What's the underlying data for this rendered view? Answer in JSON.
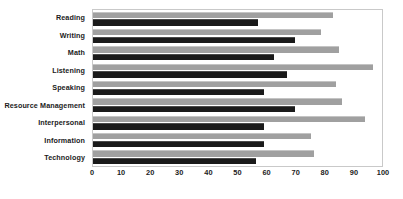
{
  "chart_data": {
    "type": "bar",
    "orientation": "horizontal",
    "title": "",
    "subtitle": "",
    "xlabel": "",
    "ylabel": "",
    "xlim": [
      0,
      100
    ],
    "xticks": [
      0,
      10,
      20,
      30,
      40,
      50,
      60,
      70,
      80,
      90,
      100
    ],
    "xtick_labels": [
      "0",
      "10",
      "20",
      "30",
      "40",
      "50",
      "60",
      "70",
      "80",
      "90",
      "100"
    ],
    "grid": false,
    "legend": null,
    "categories": [
      "Reading",
      "Writing",
      "Math",
      "Listening",
      "Speaking",
      "Resource Management",
      "Interpersonal",
      "Information",
      "Technology"
    ],
    "series": [
      {
        "name": "secondary",
        "color": "#a0a0a0",
        "values": [
          83,
          79,
          85,
          97,
          84,
          86,
          94,
          75.5,
          76.5
        ]
      },
      {
        "name": "primary",
        "color": "#1a1a1a",
        "values": [
          57,
          70,
          62.5,
          67,
          59,
          70,
          59,
          59,
          56.5
        ]
      }
    ],
    "colors": {
      "secondary_bar": "#a0a0a0",
      "primary_bar": "#1a1a1a",
      "plot_border": "#c9c9c9",
      "text": "#1b1b1b",
      "background": "#ffffff"
    }
  }
}
